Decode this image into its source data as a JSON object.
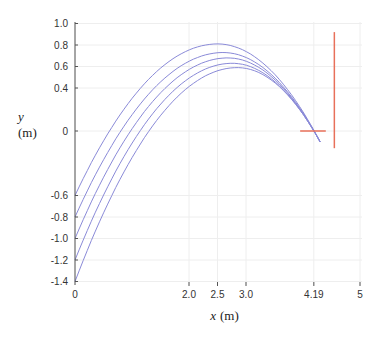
{
  "chart_data": {
    "type": "line",
    "title": "",
    "xlabel": "x (m)",
    "ylabel": "y (m)",
    "xlabel_var": "x",
    "ylabel_var": "y",
    "unit": "(m)",
    "xlim": [
      0,
      5
    ],
    "ylim": [
      -1.4,
      1.0
    ],
    "x_ticks": [
      0,
      2.0,
      2.5,
      3.0,
      4.19,
      5
    ],
    "x_tick_labels": [
      "0",
      "2.0",
      "2.5",
      "3.0",
      "4.19",
      "5"
    ],
    "y_ticks": [
      1.0,
      0.8,
      0.6,
      0.4,
      0,
      -0.6,
      -0.8,
      -1.0,
      -1.2,
      -1.4
    ],
    "y_tick_labels": [
      "1.0",
      "0.8",
      "0.6",
      "0.4",
      "0",
      "-0.6",
      "-0.8",
      "-1.0",
      "-1.2",
      "-1.4"
    ],
    "grid": true,
    "legend": null,
    "series": [
      {
        "name": "trajectory-1",
        "start_y": -0.6,
        "peak_x": 2.5,
        "peak_y": 0.81,
        "end_x": 4.3,
        "end_y": -0.1
      },
      {
        "name": "trajectory-2",
        "start_y": -0.8,
        "peak_x": 2.6,
        "peak_y": 0.73,
        "end_x": 4.3,
        "end_y": -0.1
      },
      {
        "name": "trajectory-3",
        "start_y": -1.0,
        "peak_x": 2.68,
        "peak_y": 0.68,
        "end_x": 4.3,
        "end_y": -0.1
      },
      {
        "name": "trajectory-4",
        "start_y": -1.2,
        "peak_x": 2.76,
        "peak_y": 0.63,
        "end_x": 4.3,
        "end_y": -0.1
      },
      {
        "name": "trajectory-5",
        "start_y": -1.4,
        "peak_x": 2.85,
        "peak_y": 0.59,
        "end_x": 4.3,
        "end_y": -0.1
      }
    ],
    "annotations": [
      {
        "type": "target-horizontal-line",
        "x_from": 3.95,
        "x_to": 4.4,
        "y": 0
      },
      {
        "type": "target-vertical-line",
        "x": 4.55,
        "y_from": 0.92,
        "y_to": -0.16
      }
    ]
  },
  "colors": {
    "curve": "#8a8ad8",
    "target": "#e8705a",
    "axis": "#555555",
    "grid": "#eeeeee"
  }
}
